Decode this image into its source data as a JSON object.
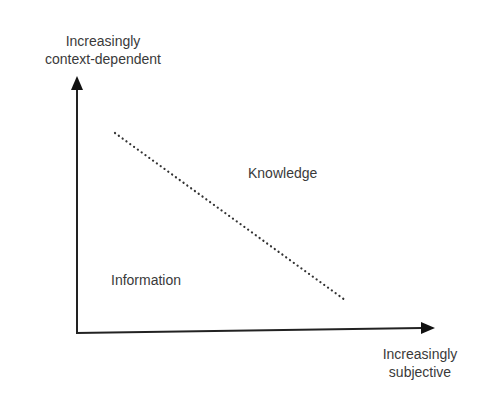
{
  "axes": {
    "y_label_line1": "Increasingly",
    "y_label_line2": "context-dependent",
    "x_label_line1": "Increasingly",
    "x_label_line2": "subjective"
  },
  "regions": {
    "upper_right": "Knowledge",
    "lower_left": "Information"
  },
  "colors": {
    "line": "#222222",
    "text": "#3a3a3a"
  }
}
